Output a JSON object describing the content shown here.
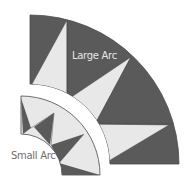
{
  "diagram": {
    "colors": {
      "dark": "#5a5a5a",
      "light": "#e8e8e8",
      "outline": "#4a4a4a",
      "background": "#ffffff"
    },
    "labels": {
      "large_arc": "Large Arc",
      "small_arc": "Small Arc"
    },
    "large_arc": {
      "center": [
        30,
        164
      ],
      "outer_radius": 149,
      "inner_radius": 80,
      "fill": "dark",
      "light_triangles": 3
    },
    "small_arc": {
      "center": [
        21,
        175
      ],
      "outer_radius": 79,
      "inner_radius": 41,
      "fill": "light",
      "dark_triangles": 4
    }
  }
}
